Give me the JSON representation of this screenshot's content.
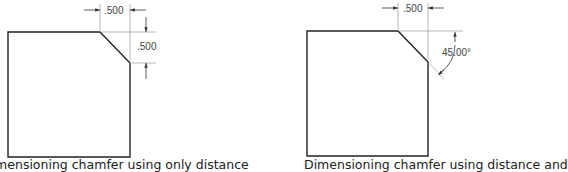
{
  "figures": [
    {
      "name": "distance-distance",
      "caption": "Dimensioning chamfer using only distance",
      "dim_horizontal": ".500",
      "dim_vertical": ".500"
    },
    {
      "name": "distance-angle",
      "caption": "Dimensioning chamfer using distance and",
      "dim_horizontal": ".500",
      "dim_angle": "45.00°"
    }
  ]
}
